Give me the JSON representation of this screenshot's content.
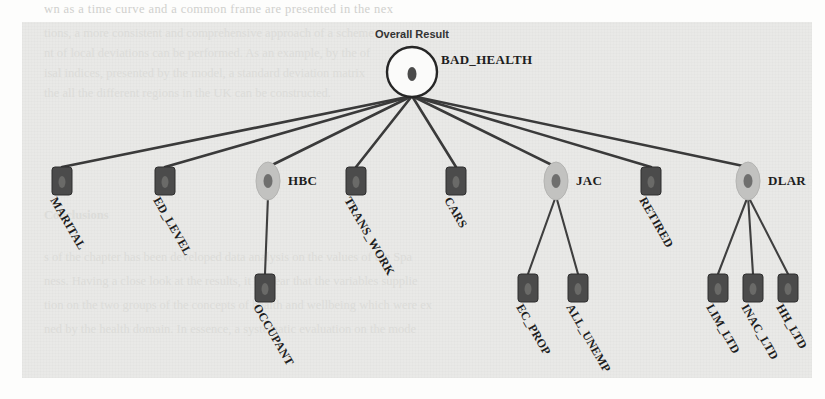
{
  "figure": {
    "title": "Overall Result",
    "root": {
      "id": "root",
      "label": "BAD_HEALTH",
      "shape": "circle",
      "x": 412,
      "y": 72,
      "rx": 25,
      "ry": 25,
      "label_x": 441,
      "label_y": 64,
      "label_anchor": "start",
      "label_rotated": false
    },
    "nodes": [
      {
        "id": "marital",
        "label": "MARITAL",
        "shape": "rect",
        "x": 62,
        "y": 181,
        "label_x": 50,
        "label_y": 200,
        "label_rotated": true,
        "parent": "root"
      },
      {
        "id": "ed_level",
        "label": "ED_LEVEL",
        "shape": "rect",
        "x": 165,
        "y": 181,
        "label_x": 153,
        "label_y": 200,
        "label_rotated": true,
        "parent": "root"
      },
      {
        "id": "hbc",
        "label": "HBC",
        "shape": "ellipse",
        "x": 268,
        "y": 181,
        "label_x": 288,
        "label_y": 185,
        "label_rotated": false,
        "parent": "root"
      },
      {
        "id": "trans_work",
        "label": "TRANS_WORK",
        "shape": "rect",
        "x": 356,
        "y": 181,
        "label_x": 344,
        "label_y": 200,
        "label_rotated": true,
        "parent": "root"
      },
      {
        "id": "cars",
        "label": "CARS",
        "shape": "rect",
        "x": 456,
        "y": 181,
        "label_x": 444,
        "label_y": 200,
        "label_rotated": true,
        "parent": "root"
      },
      {
        "id": "jac",
        "label": "JAC",
        "shape": "ellipse",
        "x": 556,
        "y": 181,
        "label_x": 576,
        "label_y": 185,
        "label_rotated": false,
        "parent": "root"
      },
      {
        "id": "retired",
        "label": "RETIRED",
        "shape": "rect",
        "x": 651,
        "y": 181,
        "label_x": 639,
        "label_y": 200,
        "label_rotated": true,
        "parent": "root"
      },
      {
        "id": "dlar",
        "label": "DLAR",
        "shape": "ellipse",
        "x": 748,
        "y": 181,
        "label_x": 768,
        "label_y": 185,
        "label_rotated": false,
        "parent": "root"
      },
      {
        "id": "occupant",
        "label": "OCCUPANT",
        "shape": "rect",
        "x": 265,
        "y": 288,
        "label_x": 253,
        "label_y": 307,
        "label_rotated": true,
        "parent": "hbc"
      },
      {
        "id": "ec_prop",
        "label": "EC_PROP",
        "shape": "rect",
        "x": 528,
        "y": 288,
        "label_x": 516,
        "label_y": 307,
        "label_rotated": true,
        "parent": "jac"
      },
      {
        "id": "all_unemp",
        "label": "ALL_UNEMP",
        "shape": "rect",
        "x": 578,
        "y": 288,
        "label_x": 566,
        "label_y": 307,
        "label_rotated": true,
        "parent": "jac"
      },
      {
        "id": "lim_ltd",
        "label": "LIM_LTD",
        "shape": "rect",
        "x": 718,
        "y": 288,
        "label_x": 706,
        "label_y": 307,
        "label_rotated": true,
        "parent": "dlar"
      },
      {
        "id": "inac_ltd",
        "label": "INAC_LTD",
        "shape": "rect",
        "x": 753,
        "y": 288,
        "label_x": 741,
        "label_y": 307,
        "label_rotated": true,
        "parent": "dlar"
      },
      {
        "id": "hh_ltd",
        "label": "HH_LTD",
        "shape": "rect",
        "x": 788,
        "y": 288,
        "label_x": 776,
        "label_y": 307,
        "label_rotated": true,
        "parent": "dlar"
      }
    ],
    "colors": {
      "panel_background": "#e9e9e7",
      "page_background": "#fdfdfc",
      "edge": "#3a3a3a",
      "leaf_node": "#4b4b4b",
      "ellipse_node": "#c2c2c0",
      "ellipse_node_inner": "#6f6f6e",
      "root_fill": "#fbfbfa",
      "root_stroke": "#262626",
      "label_text": "#1d1d1d",
      "ghost_text": "#c9c9c6"
    }
  },
  "page_ghost_text": {
    "top_lines": [
      "wn as a time curve and a common frame are presented in the nex",
      "tions, a more consistent and comprehensive approach of a scheme",
      "nt of local deviations can be performed. As an example, by the of",
      "isal indices, presented by the model, a standard deviation matrix",
      "the all the different regions in the UK can be constructed."
    ],
    "section_heading": "Conclusions",
    "bottom_lines": [
      "s of the chapter has been developed data analysis on the values of the Spa",
      "ness. Having a close look at the results, it is clear that the variables supplie",
      "tion on the two groups of the concepts of health and wellbeing which were ex",
      "ned by the health domain. In essence, a systematic evaluation on the mode"
    ]
  }
}
